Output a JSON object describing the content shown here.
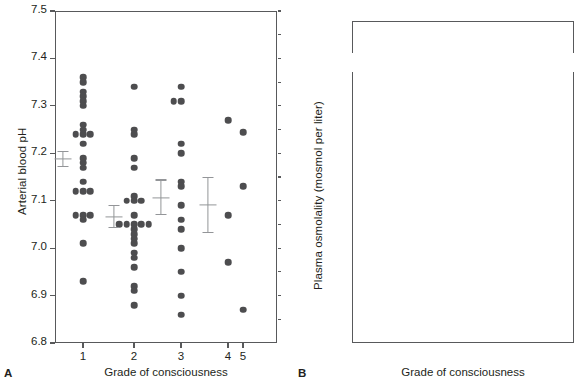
{
  "figure": {
    "panels": [
      {
        "letter": "A",
        "ylabel": "Arterial blood pH",
        "xlabel": "Grade of consciousness",
        "yticks": [
          "7.5",
          "7.4",
          "7.3",
          "7.2",
          "7.1",
          "7.0",
          "6.9",
          "6.8"
        ],
        "xticks": [
          "1",
          "2",
          "3",
          "4",
          "5"
        ]
      },
      {
        "letter": "B",
        "ylabel": "Plasma osmolality (mosmol per liter)",
        "xlabel": "Grade of consciousness",
        "yticks_upper": [
          "500",
          "450"
        ],
        "yticks": [
          "400",
          "380",
          "360",
          "340",
          "320",
          "300",
          "280"
        ],
        "xticks": [
          "1",
          "2",
          "3",
          "4",
          "5"
        ]
      }
    ]
  },
  "chart_data": [
    {
      "type": "scatter",
      "panel": "A",
      "title": "",
      "xlabel": "Grade of consciousness",
      "ylabel": "Arterial blood pH",
      "ylim": [
        6.8,
        7.5
      ],
      "ytick_values": [
        7.5,
        7.4,
        7.3,
        7.2,
        7.1,
        7.0,
        6.9,
        6.8
      ],
      "xtick_values": [
        1,
        2,
        3,
        4,
        5
      ],
      "grid": false,
      "legend": "none",
      "marker": "filled-circle",
      "groups": [
        {
          "grade": 1,
          "values": [
            7.36,
            7.35,
            7.33,
            7.32,
            7.31,
            7.3,
            7.26,
            7.25,
            7.24,
            7.24,
            7.24,
            7.22,
            7.19,
            7.18,
            7.17,
            7.14,
            7.12,
            7.12,
            7.12,
            7.07,
            7.07,
            7.07,
            7.06,
            7.01,
            6.93
          ],
          "mean": 7.188,
          "sem_upper": 7.205,
          "sem_lower": 7.171
        },
        {
          "grade": 2,
          "values": [
            7.34,
            7.25,
            7.24,
            7.19,
            7.17,
            7.11,
            7.1,
            7.1,
            7.1,
            7.07,
            7.05,
            7.05,
            7.05,
            7.05,
            7.05,
            7.04,
            7.03,
            7.02,
            7.01,
            6.99,
            6.98,
            6.96,
            6.92,
            6.91,
            6.88
          ],
          "mean": 7.066,
          "sem_upper": 7.091,
          "sem_lower": 7.042
        },
        {
          "grade": 3,
          "values": [
            7.34,
            7.31,
            7.31,
            7.22,
            7.2,
            7.14,
            7.13,
            7.09,
            7.06,
            7.04,
            7.0,
            6.95,
            6.9,
            6.86
          ],
          "mean": 7.106,
          "sem_upper": 7.145,
          "sem_lower": 7.069
        },
        {
          "grade": 4,
          "values": [
            7.27,
            7.07,
            6.97
          ],
          "mean": 7.092,
          "sem_upper": 7.15,
          "sem_lower": 7.031
        },
        {
          "grade": 5,
          "values": [
            7.245,
            7.13,
            6.87
          ],
          "mean": null,
          "sem_upper": null,
          "sem_lower": null
        }
      ]
    },
    {
      "type": "scatter",
      "panel": "B",
      "title": "",
      "xlabel": "Grade of consciousness",
      "ylabel": "Plasma osmolality (mosmol per liter)",
      "ylim": [
        275,
        410
      ],
      "ylim_upper_break": [
        445,
        510
      ],
      "ytick_values": [
        400,
        380,
        360,
        340,
        320,
        300,
        280
      ],
      "ytick_values_upper": [
        500,
        450
      ],
      "xtick_values": [
        1,
        2,
        3,
        4,
        5
      ],
      "grid": false,
      "legend": "none",
      "marker": "filled-circle",
      "marker_secondary": "open-triangle",
      "axis_break": true,
      "groups": [
        {
          "grade": 1,
          "values": [
            343,
            341,
            325,
            323,
            320,
            318,
            317,
            316,
            315,
            314,
            313,
            313,
            313,
            313,
            312,
            312,
            311,
            310,
            308,
            304,
            302,
            301,
            296,
            295,
            295,
            294,
            284
          ],
          "triangles": [],
          "mean": 316.5,
          "sem_upper": 322.5,
          "sem_lower": 310.5
        },
        {
          "grade": 2,
          "values": [
            360,
            344,
            341,
            337,
            336,
            335,
            334,
            333,
            333,
            332,
            332,
            331,
            330,
            327,
            326,
            325,
            324,
            314,
            313,
            312,
            311,
            307,
            306,
            295,
            292,
            285,
            284
          ],
          "triangles": [
            320.5
          ],
          "mean": 323.5,
          "sem_upper": 328.0,
          "sem_lower": 319.5
        },
        {
          "grade": 3,
          "values": [
            399,
            395,
            362,
            360,
            359,
            356,
            355,
            352,
            342,
            338,
            334,
            329,
            322,
            319,
            305
          ],
          "triangles": [
            377.5
          ],
          "mean": 342.0,
          "sem_upper": 348.0,
          "sem_lower": 336.0
        },
        {
          "grade": 4,
          "values": [
            477,
            393,
            356
          ],
          "triangles": [],
          "mean": 366.0,
          "sem_upper": 372.5,
          "sem_lower": 356.0
        },
        {
          "grade": 5,
          "values": [
            363,
            347
          ],
          "triangles": [
            357.5
          ],
          "mean": null,
          "sem_upper": null,
          "sem_lower": null
        }
      ]
    }
  ]
}
